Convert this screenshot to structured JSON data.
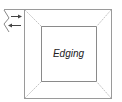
{
  "diagram": {
    "center_label": "Edging",
    "colors": {
      "outer_border": "#9a9a9a",
      "inner_border": "#8a8a8a",
      "diagonals": "#c4c4c4",
      "arrows": "#444444",
      "squiggle": "#888888"
    },
    "arrows": [
      {
        "direction": "right",
        "icon": "arrow-right-icon"
      },
      {
        "direction": "left",
        "icon": "arrow-left-icon"
      }
    ]
  }
}
